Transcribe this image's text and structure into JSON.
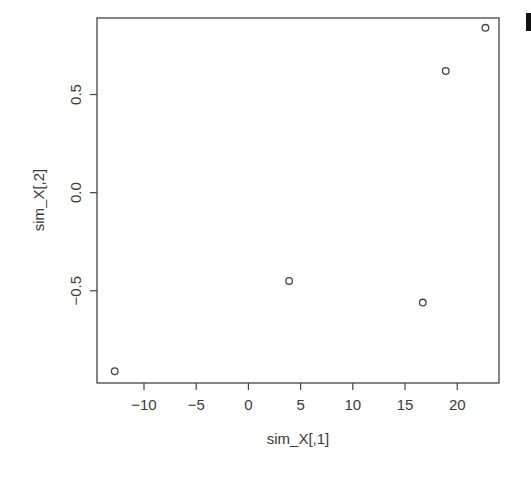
{
  "chart_data": {
    "type": "scatter",
    "title": "",
    "xlabel": "sim_X[,1]",
    "ylabel": "sim_X[,2]",
    "xlim": [
      -14.5,
      24
    ],
    "ylim": [
      -0.97,
      0.89
    ],
    "xticks": [
      -10,
      -5,
      0,
      5,
      10,
      15,
      20
    ],
    "xtick_labels": [
      "−10",
      "−5",
      "0",
      "5",
      "10",
      "15",
      "20"
    ],
    "yticks": [
      -0.5,
      0.0,
      0.5
    ],
    "ytick_labels": [
      "−0.5",
      "0.0",
      "0.5"
    ],
    "grid": false,
    "legend": null,
    "marker": "open-circle",
    "points": [
      {
        "x": -12.8,
        "y": -0.91
      },
      {
        "x": 3.9,
        "y": -0.45
      },
      {
        "x": 16.7,
        "y": -0.56
      },
      {
        "x": 18.9,
        "y": 0.62
      },
      {
        "x": 22.7,
        "y": 0.84
      }
    ]
  },
  "colors": {
    "axis": "#444444",
    "marker": "#444444",
    "text": "#3a3a3a",
    "background": "#ffffff"
  }
}
